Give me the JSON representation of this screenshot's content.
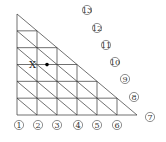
{
  "diagram": {
    "type": "triangular-grid",
    "subdivisions": 6,
    "point_label": "X",
    "line_color": "#333333",
    "bottom_labels": [
      "1",
      "2",
      "3",
      "4",
      "5",
      "6"
    ],
    "right_labels": [
      "7",
      "8",
      "9",
      "10",
      "11",
      "12",
      "13"
    ]
  }
}
